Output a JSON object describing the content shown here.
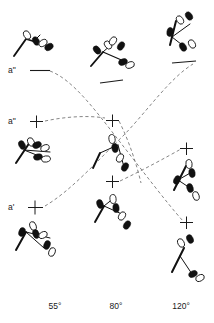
{
  "figure": {
    "title": "",
    "type": "orbital-correlation-diagram",
    "background_color": "#ffffff",
    "line_color": "#111111",
    "dash_color": "#6f6f6f"
  },
  "symmetry_labels": [
    {
      "id": "a2-top",
      "text": "a\"",
      "x": 8,
      "y": 66
    },
    {
      "id": "a2-middle",
      "text": "a\"",
      "x": 8,
      "y": 118
    },
    {
      "id": "a1-bottom",
      "text": "a'",
      "x": 8,
      "y": 203
    }
  ],
  "axis": {
    "name": "bond-angle-axis",
    "ticks": [
      {
        "label": "55°",
        "x": 55
      },
      {
        "label": "80°",
        "x": 116
      },
      {
        "label": "120°",
        "x": 180
      }
    ],
    "y": 306
  },
  "level_markers": [
    {
      "id": "lvl-a2-55",
      "kind": "line",
      "x": 30,
      "y": 70,
      "w": 20
    },
    {
      "id": "lvl-a2-80",
      "kind": "line",
      "x": 100,
      "y": 83,
      "w": 22
    },
    {
      "id": "lvl-a2-120",
      "kind": "line",
      "x": 172,
      "y": 62,
      "w": 22
    },
    {
      "id": "lvl-a2m-55",
      "kind": "plus",
      "x": 36,
      "y": 122
    },
    {
      "id": "lvl-a2m-80",
      "kind": "plus",
      "x": 112,
      "y": 120
    },
    {
      "id": "lvl-a2m-120",
      "kind": "plus",
      "x": 186,
      "y": 148
    },
    {
      "id": "lvl-a1-55",
      "kind": "plus",
      "x": 34,
      "y": 208
    },
    {
      "id": "lvl-a1-80",
      "kind": "plus",
      "x": 112,
      "y": 182
    },
    {
      "id": "lvl-a1-120",
      "kind": "plus",
      "x": 186,
      "y": 222
    }
  ],
  "correlation_lines": [
    {
      "id": "corr-a2-to-a1",
      "from": "a\" (55°)",
      "to": "a' (120°)",
      "path": "M 50 70 C 72 78 96 112 118 140 C 140 168 164 200 182 222"
    },
    {
      "id": "corr-a1-to-a2",
      "from": "a' (55°)",
      "to": "a\" (120°)",
      "path": "M 44 207 C 70 190 96 160 122 136 C 146 112 168 80 192 64"
    },
    {
      "id": "corr-mid-a2",
      "from": "a\" (55° mid)",
      "to": "a\" (80° mid)",
      "path": "M 44 122 C 62 118 84 116 104 119"
    },
    {
      "id": "corr-mid-down",
      "from": "a\" (80° mid)",
      "to": "a' (120°)",
      "path": "M 120 121 C 130 142 136 166 140 182"
    },
    {
      "id": "corr-a1-mid",
      "from": "a' (80°)",
      "to": "a\" (120° mid)",
      "path": "M 120 181 C 142 170 164 158 180 150"
    }
  ],
  "orbital_clusters": [
    {
      "id": "cluster-a2-55",
      "column": "55°",
      "row": "a\"",
      "lobes": 3
    },
    {
      "id": "cluster-a2-80",
      "column": "80°",
      "row": "a\"",
      "lobes": 4
    },
    {
      "id": "cluster-a2-120",
      "column": "120°",
      "row": "a\"",
      "lobes": 3
    },
    {
      "id": "cluster-mid-55",
      "column": "55°",
      "row": "a\" (middle)",
      "lobes": 4
    },
    {
      "id": "cluster-mid-80",
      "column": "80°",
      "row": "a\" (middle)",
      "lobes": 3
    },
    {
      "id": "cluster-mid-120",
      "column": "120°",
      "row": "a\" (middle)",
      "lobes": 4
    },
    {
      "id": "cluster-a1-55",
      "column": "55°",
      "row": "a'",
      "lobes": 4
    },
    {
      "id": "cluster-a1-80",
      "column": "80°",
      "row": "a'",
      "lobes": 4
    },
    {
      "id": "cluster-a1-120",
      "column": "120°",
      "row": "a'",
      "lobes": 2
    }
  ]
}
